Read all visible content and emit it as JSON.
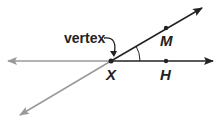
{
  "labels": {
    "vertex": "vertex",
    "x": "X",
    "m": "M",
    "h": "H"
  },
  "colors": {
    "dark": "#222222",
    "gray": "#999999"
  }
}
